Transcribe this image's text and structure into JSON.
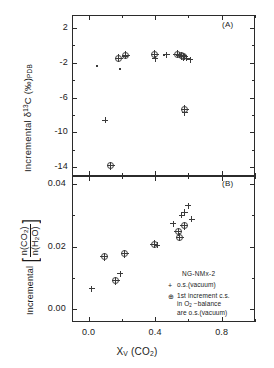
{
  "figure": {
    "xlabel_html": "X<sub>V</sub> (CO<sub>2</sub>)",
    "panelA_label": "(A)",
    "panelB_label": "(B)"
  },
  "legend": {
    "title": "NG-NMx-2",
    "entry_plus": "o.s.(vacuum)",
    "entry_circle_line1": "1st increment c.s.",
    "entry_circle_line2_html": "in O<sub>2</sub> −balance",
    "entry_circle_line3": "are o.s.(vacuum)"
  },
  "chart_data": [
    {
      "type": "scatter",
      "panel": "A",
      "title": "",
      "xlabel": "X_V (CO2)",
      "ylabel": "Incremental δ 13C (‰)PDB",
      "xlim": [
        -0.1,
        1.0
      ],
      "ylim": [
        -15.0,
        3.5
      ],
      "xticks": [
        0.0,
        0.4,
        0.8
      ],
      "xticklabels": [
        "0.0",
        "0.4",
        "0.8"
      ],
      "yticks": [
        2,
        -2,
        -6,
        -10,
        -14
      ],
      "yticklabels": [
        "2",
        "-2",
        "-6",
        "-10",
        "-14"
      ],
      "grid": false,
      "series": [
        {
          "name": "o.s.(vacuum)",
          "marker": "plus",
          "points": [
            [
              0.1,
              -8.6
            ],
            [
              0.22,
              -1.25
            ],
            [
              0.4,
              -1.55
            ],
            [
              0.47,
              -1.05
            ],
            [
              0.545,
              -1.15
            ],
            [
              0.575,
              -1.3
            ],
            [
              0.59,
              -1.45
            ],
            [
              0.612,
              -1.65
            ],
            [
              0.578,
              -7.75
            ]
          ]
        },
        {
          "name": "1st increment c.s. in O2-balance are o.s.(vacuum)",
          "marker": "circle-plus",
          "points": [
            [
              0.133,
              -13.85
            ],
            [
              0.182,
              -1.45
            ],
            [
              0.222,
              -1.1
            ],
            [
              0.398,
              -1.0
            ],
            [
              0.533,
              -1.0
            ],
            [
              0.56,
              -1.2
            ],
            [
              0.573,
              -1.3
            ],
            [
              0.578,
              -7.35
            ]
          ]
        },
        {
          "name": "small points",
          "marker": "dot",
          "points": [
            [
              0.05,
              -2.35
            ],
            [
              0.19,
              -2.75
            ],
            [
              0.455,
              -1.1
            ],
            [
              0.585,
              -1.2
            ]
          ]
        }
      ]
    },
    {
      "type": "scatter",
      "panel": "B",
      "title": "",
      "xlabel": "X_V (CO2)",
      "ylabel": "Incremental [n(CO2)/n(H2O)]",
      "xlim": [
        -0.1,
        1.0
      ],
      "ylim": [
        -0.004,
        0.0425
      ],
      "xticks": [
        0.0,
        0.4,
        0.8
      ],
      "xticklabels": [
        "0.0",
        "0.4",
        "0.8"
      ],
      "yticks": [
        0.04,
        0.02,
        0.0
      ],
      "yticklabels": [
        "0.04",
        "0.02",
        "0.00"
      ],
      "grid": false,
      "series": [
        {
          "name": "o.s.(vacuum)",
          "marker": "plus",
          "points": [
            [
              0.018,
              0.0066
            ],
            [
              0.19,
              0.0114
            ],
            [
              0.412,
              0.0205
            ],
            [
              0.508,
              0.0273
            ],
            [
              0.56,
              0.03
            ],
            [
              0.578,
              0.031
            ],
            [
              0.6,
              0.033
            ],
            [
              0.62,
              0.0288
            ]
          ]
        },
        {
          "name": "1st increment c.s. in O2-balance are o.s.(vacuum)",
          "marker": "circle-plus",
          "points": [
            [
              0.093,
              0.0168
            ],
            [
              0.163,
              0.0091
            ],
            [
              0.218,
              0.0178
            ],
            [
              0.395,
              0.0207
            ],
            [
              0.54,
              0.0248
            ],
            [
              0.548,
              0.023
            ],
            [
              0.575,
              0.0267
            ]
          ]
        }
      ]
    }
  ]
}
